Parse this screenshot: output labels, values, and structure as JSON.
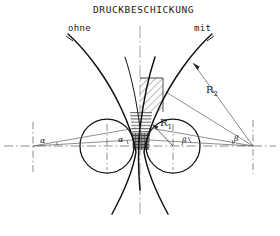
{
  "figure": {
    "title": "DRUCKBESCHICKUNG",
    "labels": {
      "left_case": "ohne",
      "right_case": "mit",
      "radius_small": "R1",
      "radius_large": "R2",
      "angle_alpha_outer": "α",
      "angle_alpha_inner": "α",
      "angle_beta_inner": "β",
      "angle_beta_outer": "β"
    },
    "colors": {
      "ink": "#1a1a1a",
      "curve": "#111111",
      "thin_line": "#5a5a5a",
      "centerline": "#6e6e6e",
      "hatch_fill": "#7a7a7a",
      "dark_block": "#6b6b6b",
      "background": "#ffffff"
    },
    "geometry": {
      "axis_y": 146,
      "center_x": 140,
      "left_circle": {
        "cx": 107,
        "cy": 146,
        "r": 27
      },
      "right_circle": {
        "cx": 173,
        "cy": 146,
        "r": 27
      },
      "alpha_vertex": {
        "x": 33,
        "y": 146
      },
      "beta_vertex": {
        "x": 253,
        "y": 146
      },
      "r1_from": {
        "x": 173,
        "y": 146
      },
      "r1_to": {
        "x": 152,
        "y": 124
      },
      "r2_from": {
        "x": 253,
        "y": 146
      },
      "r2_to": {
        "x": 193,
        "y": 63
      }
    },
    "zones": [
      {
        "name": "diagonal-hatch-zone",
        "style": "diagonal",
        "y_top": 78,
        "y_bottom": 112
      },
      {
        "name": "horizontal-hatch-zone",
        "style": "horizontal",
        "y_top": 112,
        "y_bottom": 133
      },
      {
        "name": "dark-crosshatch-zone",
        "style": "dark",
        "y_top": 133,
        "y_bottom": 150
      }
    ]
  }
}
